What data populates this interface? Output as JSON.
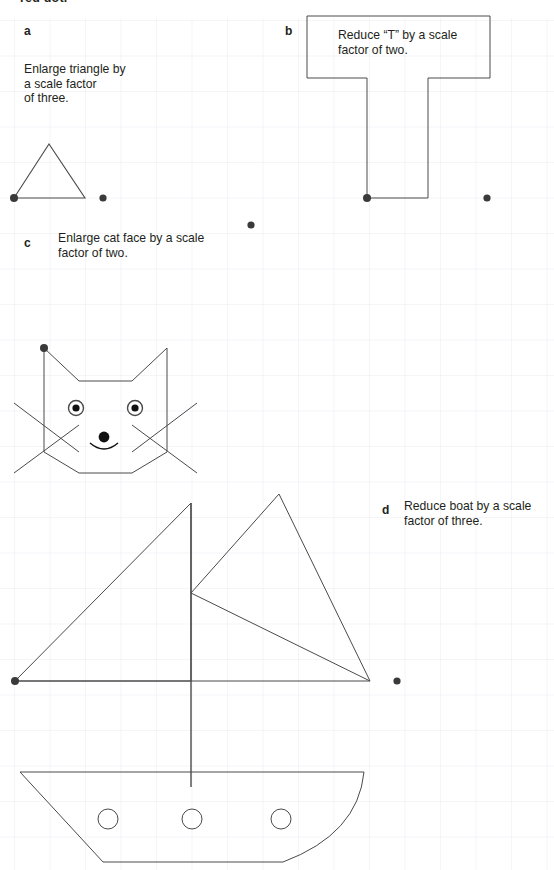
{
  "page": {
    "width": 554,
    "height": 870,
    "background": "#ffffff",
    "cut_off_header": "red dot.",
    "grid": {
      "spacing": 35.5,
      "origin_x": 14,
      "origin_y": 20,
      "color": "#e9e9ee",
      "line_width": 0.8
    },
    "ink_color": "#4a4a4a",
    "dot_color": "#3a3a3a",
    "text_color": "#231f20"
  },
  "parts": [
    {
      "id": "a",
      "letter": "a",
      "letter_pos": {
        "x": 24,
        "y": 24
      },
      "instruction": "Enlarge triangle by\na scale factor\nof three.",
      "instruction_pos": {
        "x": 24,
        "y": 62
      },
      "shape": "triangle",
      "centre_of_enlargement": {
        "x": 14,
        "y": 198
      },
      "points": [
        {
          "x": 14,
          "y": 198
        },
        {
          "x": 49,
          "y": 144
        },
        {
          "x": 85,
          "y": 198
        }
      ],
      "extra_dots": [
        {
          "x": 103,
          "y": 198
        }
      ]
    },
    {
      "id": "b",
      "letter": "b",
      "letter_pos": {
        "x": 285,
        "y": 24
      },
      "instruction": "Reduce “T” by a scale\nfactor of two.",
      "instruction_pos": {
        "x": 338,
        "y": 28
      },
      "shape": "letter-T",
      "centre_of_enlargement": {
        "x": 367,
        "y": 198
      },
      "points": [
        {
          "x": 307,
          "y": 16
        },
        {
          "x": 490,
          "y": 16
        },
        {
          "x": 490,
          "y": 78
        },
        {
          "x": 428,
          "y": 78
        },
        {
          "x": 428,
          "y": 198
        },
        {
          "x": 367,
          "y": 198
        },
        {
          "x": 367,
          "y": 78
        },
        {
          "x": 307,
          "y": 78
        }
      ],
      "extra_dots": [
        {
          "x": 487,
          "y": 198
        }
      ]
    },
    {
      "id": "c",
      "letter": "c",
      "letter_pos": {
        "x": 24,
        "y": 236
      },
      "instruction": "Enlarge cat face by a scale\nfactor of two.",
      "instruction_pos": {
        "x": 58,
        "y": 231
      },
      "shape": "cat-face",
      "centre_of_enlargement": {
        "x": 44,
        "y": 348
      },
      "head_outline": [
        {
          "x": 44,
          "y": 348
        },
        {
          "x": 44,
          "y": 452
        },
        {
          "x": 79,
          "y": 473
        },
        {
          "x": 132,
          "y": 473
        },
        {
          "x": 167,
          "y": 452
        },
        {
          "x": 167,
          "y": 348
        },
        {
          "x": 132,
          "y": 381
        },
        {
          "x": 79,
          "y": 381
        }
      ],
      "eyes": [
        {
          "cx": 76,
          "cy": 408,
          "r_outer": 7.5,
          "r_inner": 3.6
        },
        {
          "cx": 135,
          "cy": 408,
          "r_outer": 7.5,
          "r_inner": 3.6
        }
      ],
      "nose": {
        "cx": 104,
        "cy": 437,
        "r": 5.4
      },
      "mouth": {
        "cx": 104,
        "cy": 447,
        "rx": 14,
        "ry": 8
      },
      "whiskers": [
        {
          "x1": 14,
          "y1": 403,
          "x2": 79,
          "y2": 452
        },
        {
          "x1": 14,
          "y1": 473,
          "x2": 79,
          "y2": 425
        },
        {
          "x1": 197,
          "y1": 403,
          "x2": 132,
          "y2": 452
        },
        {
          "x1": 197,
          "y1": 473,
          "x2": 132,
          "y2": 425
        }
      ],
      "extra_dots": [
        {
          "x": 251,
          "y": 225
        }
      ]
    },
    {
      "id": "d",
      "letter": "d",
      "letter_pos": {
        "x": 382,
        "y": 503
      },
      "instruction": "Reduce boat by a scale\nfactor of three.",
      "instruction_pos": {
        "x": 404,
        "y": 499
      },
      "shape": "boat",
      "centre_of_enlargement": {
        "x": 15,
        "y": 681
      },
      "mast": {
        "x": 191,
        "y_top": 503,
        "y_bottom": 787
      },
      "deck": {
        "x1": 15,
        "y1": 681,
        "x2": 370,
        "y2": 681
      },
      "front_sail": [
        {
          "x": 191,
          "y": 503
        },
        {
          "x": 191,
          "y": 681
        },
        {
          "x": 15,
          "y": 681
        }
      ],
      "back_sail": [
        {
          "x": 279,
          "y": 494
        },
        {
          "x": 370,
          "y": 681
        },
        {
          "x": 191,
          "y": 593
        }
      ],
      "hull": [
        {
          "x": 20,
          "y": 772
        },
        {
          "x": 364,
          "y": 772
        },
        {
          "x": 283,
          "y": 862
        },
        {
          "x": 103,
          "y": 862
        }
      ],
      "hull_curve_right": true,
      "portholes": [
        {
          "cx": 108,
          "cy": 819,
          "r": 10
        },
        {
          "cx": 192,
          "cy": 819,
          "r": 10
        },
        {
          "cx": 281,
          "cy": 819,
          "r": 10
        }
      ],
      "extra_dots": [
        {
          "x": 397,
          "y": 681
        }
      ]
    }
  ]
}
